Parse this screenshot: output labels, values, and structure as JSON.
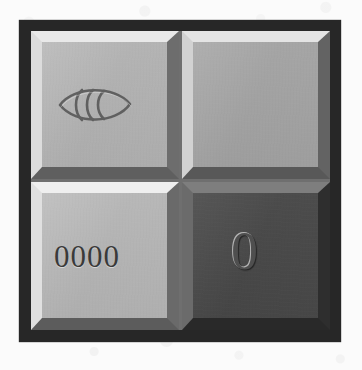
{
  "page": {
    "background_color": "#fbfbfb"
  },
  "frame": {
    "border_color": "#272727",
    "inner_background": "#8e8e8e"
  },
  "panel": {
    "label": "four-tile-panel",
    "columns": 2,
    "rows": 2,
    "tiles": [
      {
        "position": "top-left",
        "name": "tile-eye",
        "face_color": "#b5b5b5",
        "bevel_light": "#e9e9e9",
        "bevel_dark": "#5f5f5f",
        "content_type": "icon",
        "icon": "eye-icon",
        "text": ""
      },
      {
        "position": "top-right",
        "name": "tile-blank",
        "face_color": "#a6a6a6",
        "bevel_light": "#e4e4e4",
        "bevel_dark": "#585858",
        "content_type": "empty",
        "icon": "",
        "text": ""
      },
      {
        "position": "bottom-left",
        "name": "tile-zeros",
        "face_color": "#b8b8b8",
        "bevel_light": "#efefef",
        "bevel_dark": "#5c5c5c",
        "content_type": "text",
        "icon": "",
        "text": "0000"
      },
      {
        "position": "bottom-right",
        "name": "tile-zero-dark",
        "face_color": "#4b4b4b",
        "bevel_light": "#7e7e7e",
        "bevel_dark": "#292929",
        "content_type": "text",
        "icon": "",
        "text": "0"
      }
    ]
  },
  "eye_icon": {
    "name": "eye-icon",
    "stroke_color": "#5a5a5a",
    "arcs": 3,
    "style": "engraved-almond-outline-with-nested-crescents"
  }
}
